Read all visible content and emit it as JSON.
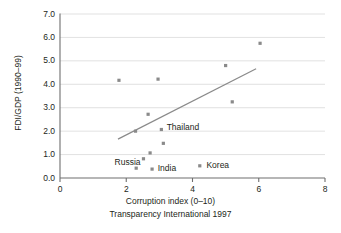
{
  "chart_data": {
    "type": "scatter",
    "title": "",
    "xlabel": "Corruption index (0–10)",
    "xlabel_sub": "Transparency International 1997",
    "ylabel": "FDI/GDP (1990–99)",
    "xlim": [
      0,
      8
    ],
    "ylim": [
      0,
      7
    ],
    "xticks": [
      0,
      2,
      4,
      6,
      8
    ],
    "xticklabels": [
      "0",
      "2",
      "4",
      "6",
      "8"
    ],
    "yticks": [
      0.0,
      1.0,
      2.0,
      3.0,
      4.0,
      5.0,
      6.0,
      7.0
    ],
    "yticklabels": [
      "0.0",
      "1.0",
      "2.0",
      "3.0",
      "4.0",
      "5.0",
      "6.0",
      "7.0"
    ],
    "grid": "horizontal",
    "legend": "none",
    "marker": "square",
    "marker_color": "#8a8a8a",
    "line_color": "#8a8a8a",
    "axis_color": "#6e6e6e",
    "grid_color": "#d9d9d9",
    "points": [
      {
        "x": 1.78,
        "y": 4.17,
        "label": ""
      },
      {
        "x": 2.28,
        "y": 2.0,
        "label": ""
      },
      {
        "x": 2.3,
        "y": 0.42,
        "label": "Russia"
      },
      {
        "x": 2.52,
        "y": 0.82,
        "label": ""
      },
      {
        "x": 2.66,
        "y": 2.72,
        "label": ""
      },
      {
        "x": 2.72,
        "y": 1.07,
        "label": ""
      },
      {
        "x": 2.78,
        "y": 0.38,
        "label": "India"
      },
      {
        "x": 2.96,
        "y": 4.22,
        "label": ""
      },
      {
        "x": 3.06,
        "y": 2.07,
        "label": "Thailand"
      },
      {
        "x": 3.12,
        "y": 1.48,
        "label": ""
      },
      {
        "x": 4.22,
        "y": 0.52,
        "label": "Korea"
      },
      {
        "x": 5.0,
        "y": 4.8,
        "label": ""
      },
      {
        "x": 5.2,
        "y": 3.25,
        "label": ""
      },
      {
        "x": 6.04,
        "y": 5.75,
        "label": ""
      }
    ],
    "trendline": {
      "x0": 1.75,
      "y0": 1.66,
      "x1": 5.92,
      "y1": 4.66
    },
    "annotations": [
      {
        "text": "Thailand",
        "x": 3.22,
        "y": 2.12
      },
      {
        "text": "Russia",
        "x": 1.95,
        "y": 0.66
      },
      {
        "text": "India",
        "x": 2.95,
        "y": 0.4
      },
      {
        "text": "Korea",
        "x": 4.42,
        "y": 0.52
      }
    ]
  }
}
